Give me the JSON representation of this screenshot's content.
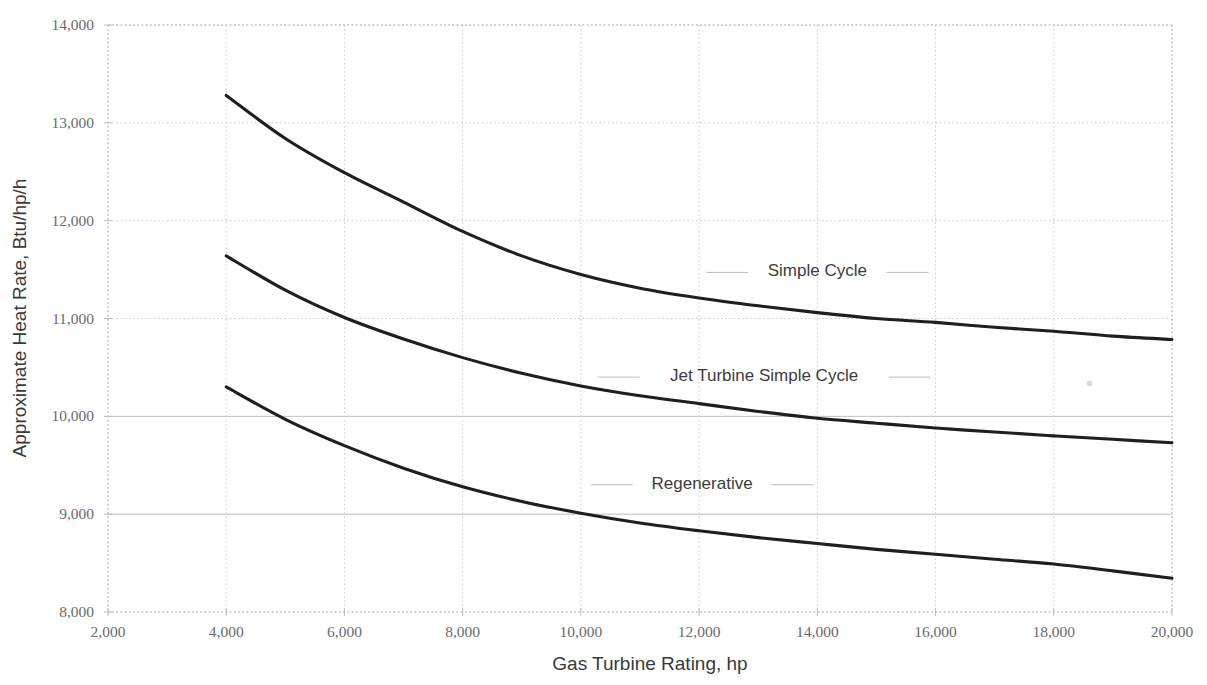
{
  "chart_data": {
    "type": "line",
    "title": "",
    "xlabel": "Gas Turbine Rating, hp",
    "ylabel": "Approximate Heat Rate, Btu/hp/h",
    "xlim": [
      2000,
      20000
    ],
    "ylim": [
      8000,
      14000
    ],
    "xticks": [
      2000,
      4000,
      6000,
      8000,
      10000,
      12000,
      14000,
      16000,
      18000,
      20000
    ],
    "yticks": [
      8000,
      9000,
      10000,
      11000,
      12000,
      13000,
      14000
    ],
    "xtick_labels": [
      "2,000",
      "4,000",
      "6,000",
      "8,000",
      "10,000",
      "12,000",
      "14,000",
      "16,000",
      "18,000",
      "20,000"
    ],
    "ytick_labels": [
      "8,000",
      "9,000",
      "10,000",
      "11,000",
      "12,000",
      "13,000",
      "14,000"
    ],
    "grid": true,
    "legend_position": "inline-annotations",
    "line_color": "#1f1f1f",
    "x": [
      4000,
      5000,
      6000,
      7000,
      8000,
      9000,
      10000,
      11000,
      12000,
      13000,
      14000,
      15000,
      16000,
      17000,
      18000,
      19000,
      20000
    ],
    "series": [
      {
        "name": "Simple Cycle",
        "values": [
          13280,
          12840,
          12490,
          12190,
          11890,
          11640,
          11450,
          11310,
          11210,
          11130,
          11060,
          11000,
          10960,
          10910,
          10870,
          10820,
          10785
        ]
      },
      {
        "name": "Jet Turbine Simple Cycle",
        "values": [
          11640,
          11290,
          11010,
          10790,
          10600,
          10440,
          10310,
          10210,
          10130,
          10050,
          9980,
          9930,
          9880,
          9840,
          9800,
          9765,
          9730
        ]
      },
      {
        "name": "Regenerative",
        "values": [
          10300,
          9970,
          9700,
          9470,
          9280,
          9130,
          9010,
          8910,
          8830,
          8760,
          8700,
          8640,
          8590,
          8540,
          8490,
          8420,
          8345
        ]
      }
    ],
    "annotations": [
      {
        "text": "Simple Cycle",
        "x": 14000,
        "y": 11430
      },
      {
        "text": "Jet Turbine Simple Cycle",
        "x": 13100,
        "y": 10360
      },
      {
        "text": "Regenerative",
        "x": 12050,
        "y": 9260
      }
    ]
  },
  "plot": {
    "left_px": 108,
    "right_px": 1172,
    "top_px": 25,
    "bottom_px": 612
  }
}
